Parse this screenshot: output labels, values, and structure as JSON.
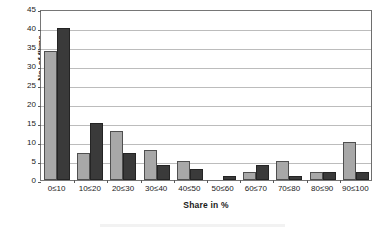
{
  "chart_data": {
    "type": "bar",
    "title": "",
    "subtitle": "",
    "xlabel": "Share in %",
    "ylabel": "No. of firms",
    "categories": [
      "0≤10",
      "10≤20",
      "20≤30",
      "30≤40",
      "40≤50",
      "50≤60",
      "60≤70",
      "70≤80",
      "80≤90",
      "90≤100"
    ],
    "series": [
      {
        "name": "series-light",
        "color": "#a8a8a8",
        "values": [
          34,
          7,
          13,
          8,
          5,
          0,
          2,
          5,
          2,
          10
        ]
      },
      {
        "name": "series-dark",
        "color": "#3a3a3a",
        "values": [
          40,
          15,
          7,
          4,
          3,
          1,
          4,
          1,
          2,
          2
        ]
      }
    ],
    "ylim": [
      0,
      45
    ],
    "ytick_step": 5,
    "yticks": [
      0,
      5,
      10,
      15,
      20,
      25,
      30,
      35,
      40,
      45
    ],
    "ytick_labels": [
      "0",
      "5",
      "10",
      "15",
      "20",
      "25",
      "30",
      "35",
      "40",
      "45"
    ],
    "grid": true,
    "grid_axis": "y",
    "legend": false,
    "legend_position": "none",
    "annotations": []
  }
}
